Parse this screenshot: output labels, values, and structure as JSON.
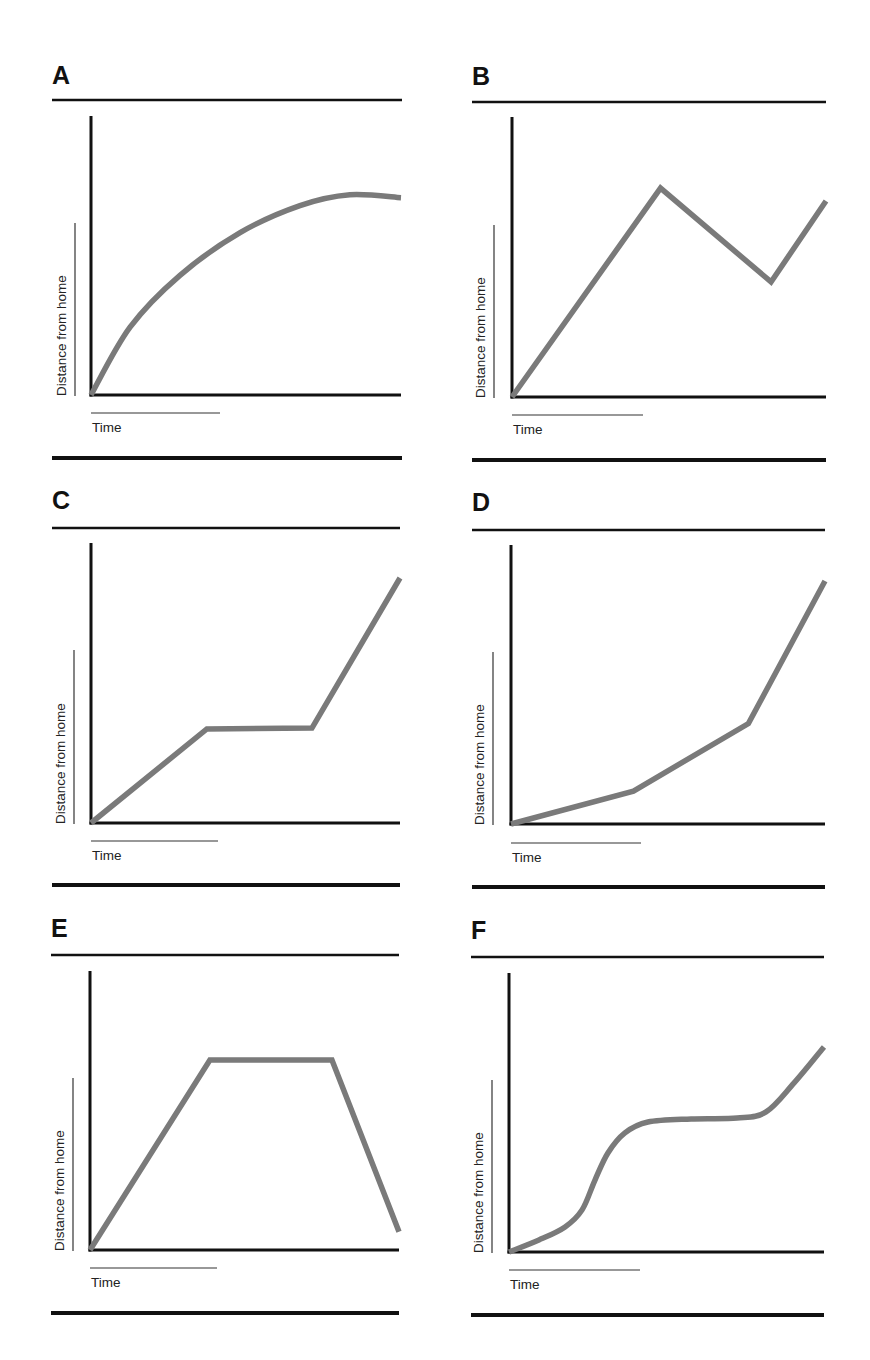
{
  "figure": {
    "panel_count": 6
  },
  "chart_data": [
    {
      "id": "A",
      "type": "line",
      "title": "A",
      "xlabel": "Time",
      "ylabel": "Distance from home",
      "xlim": [
        0,
        10
      ],
      "ylim": [
        0,
        10
      ],
      "smooth": true,
      "x": [
        0,
        1.26,
        2.87,
        4.81,
        6.74,
        8.35,
        10
      ],
      "y": [
        0,
        2.43,
        4.29,
        5.82,
        6.79,
        7.18,
        7.07
      ],
      "line_color": "#7a7a7a"
    },
    {
      "id": "B",
      "type": "line",
      "title": "B",
      "xlabel": "Time",
      "ylabel": "Distance from home",
      "xlim": [
        0,
        10
      ],
      "ylim": [
        0,
        10
      ],
      "smooth": false,
      "x": [
        0,
        4.73,
        8.25,
        10
      ],
      "y": [
        0,
        7.46,
        4.11,
        7.0
      ],
      "line_color": "#7a7a7a"
    },
    {
      "id": "C",
      "type": "line",
      "title": "C",
      "xlabel": "Time",
      "ylabel": "Distance from home",
      "xlim": [
        0,
        10
      ],
      "ylim": [
        0,
        10
      ],
      "smooth": false,
      "x": [
        0,
        3.75,
        7.15,
        10
      ],
      "y": [
        0,
        3.36,
        3.39,
        8.75
      ],
      "line_color": "#7a7a7a"
    },
    {
      "id": "D",
      "type": "line",
      "title": "D",
      "xlabel": "Time",
      "ylabel": "Distance from home",
      "xlim": [
        0,
        10
      ],
      "ylim": [
        0,
        10
      ],
      "smooth": false,
      "x": [
        0,
        3.9,
        7.56,
        10
      ],
      "y": [
        0,
        1.18,
        3.6,
        8.71
      ],
      "line_color": "#7a7a7a"
    },
    {
      "id": "E",
      "type": "line",
      "title": "E",
      "xlabel": "Time",
      "ylabel": "Distance from home",
      "xlim": [
        0,
        10
      ],
      "ylim": [
        0,
        10
      ],
      "smooth": false,
      "x": [
        0,
        3.88,
        7.83,
        10
      ],
      "y": [
        0,
        6.81,
        6.81,
        0.65
      ],
      "line_color": "#7a7a7a"
    },
    {
      "id": "F",
      "type": "line",
      "title": "F",
      "xlabel": "Time",
      "ylabel": "Distance from home",
      "xlim": [
        0,
        10
      ],
      "ylim": [
        0,
        10
      ],
      "smooth": true,
      "x": [
        0,
        0.95,
        1.78,
        2.32,
        2.73,
        3.14,
        3.68,
        4.41,
        5.78,
        7.24,
        8.16,
        9.05,
        10
      ],
      "y": [
        0,
        0.43,
        0.9,
        1.51,
        2.58,
        3.55,
        4.27,
        4.66,
        4.77,
        4.8,
        5.02,
        6.06,
        7.35
      ],
      "line_color": "#7a7a7a"
    }
  ]
}
